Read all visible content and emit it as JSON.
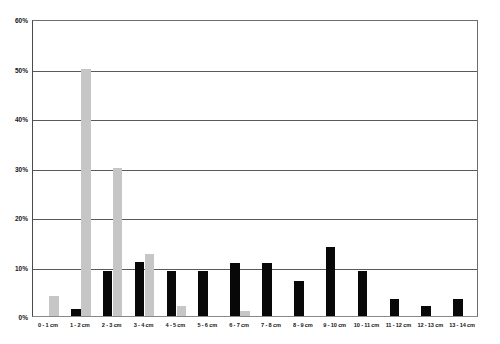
{
  "chart_data": {
    "type": "bar",
    "title": "",
    "subtitle": "",
    "xlabel": "",
    "ylabel": "",
    "ylim": [
      0,
      60
    ],
    "yunit": "%",
    "ytick_labels": [
      "0%",
      "10%",
      "20%",
      "30%",
      "40%",
      "50%",
      "60%"
    ],
    "ytick_values": [
      0,
      10,
      20,
      30,
      40,
      50,
      60
    ],
    "grid": true,
    "legend": "none",
    "categories": [
      "0 - 1 cm",
      "1 - 2 cm",
      "2 - 3 cm",
      "3 - 4 cm",
      "4 - 5 cm",
      "5 - 6 cm",
      "6 - 7 cm",
      "7 - 8 cm",
      "8 - 9 cm",
      "9 - 10 cm",
      "10 - 11 cm",
      "11 - 12 cm",
      "12 - 13 cm",
      "13 - 14 cm"
    ],
    "series": [
      {
        "name": "series-black",
        "color": "#080808",
        "values": [
          0,
          1.5,
          9,
          11,
          9,
          9,
          10.7,
          10.7,
          7,
          14,
          9,
          3.5,
          2,
          3.5
        ]
      },
      {
        "name": "series-gray",
        "color": "#c6c6c6",
        "values": [
          4,
          50,
          30,
          12.5,
          2,
          0,
          1,
          0,
          0,
          0,
          0,
          0,
          0,
          0
        ]
      }
    ]
  },
  "axes": {
    "plot_border_color": "#6e6e6e",
    "gridline_color": "#5a5a5a"
  }
}
